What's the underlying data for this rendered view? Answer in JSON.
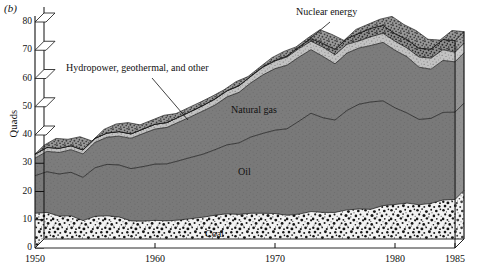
{
  "figure": {
    "panel_label": "(b)",
    "ylabel": "Quads"
  },
  "labels": {
    "coal": "Coal",
    "oil": "Oil",
    "natural_gas": "Natural gas",
    "hydro": "Hydropower, geothermal, and other",
    "nuclear": "Nuclear energy"
  },
  "colors": {
    "coal": "#d9d9d9",
    "oil": "#7b7b7b",
    "natural_gas": "#7b7b7b",
    "hydro": "#bdbdbd",
    "nuclear": "#6e6e6e",
    "outline": "#111111",
    "axis": "#111111",
    "background": "#ffffff"
  },
  "chart_data": {
    "type": "area",
    "title": "",
    "xlabel": "",
    "ylabel": "Quads",
    "xlim": [
      1950,
      1985
    ],
    "ylim": [
      0,
      80
    ],
    "grid": false,
    "legend": "inline-annotations",
    "xticks": [
      1950,
      1960,
      1970,
      1980,
      1985
    ],
    "yticks": [
      0,
      10,
      20,
      30,
      40,
      50,
      60,
      70,
      80
    ],
    "x": [
      1950,
      1951,
      1952,
      1953,
      1954,
      1955,
      1956,
      1957,
      1958,
      1959,
      1960,
      1961,
      1962,
      1963,
      1964,
      1965,
      1966,
      1967,
      1968,
      1969,
      1970,
      1971,
      1972,
      1973,
      1974,
      1975,
      1976,
      1977,
      1978,
      1979,
      1980,
      1981,
      1982,
      1983,
      1984,
      1985
    ],
    "stack_order": [
      "Coal",
      "Oil",
      "Natural gas",
      "Hydropower, geothermal, and other",
      "Nuclear energy"
    ],
    "series": [
      {
        "name": "Coal",
        "values": [
          12.3,
          12.6,
          11.3,
          11.4,
          9.7,
          11.2,
          11.4,
          11.0,
          9.6,
          9.5,
          9.8,
          9.6,
          9.9,
          10.4,
          10.9,
          11.6,
          12.1,
          11.9,
          12.3,
          12.3,
          12.2,
          11.6,
          12.0,
          12.9,
          12.6,
          12.6,
          13.5,
          13.8,
          13.7,
          15.0,
          15.4,
          15.9,
          15.3,
          15.8,
          17.0,
          17.2
        ]
      },
      {
        "name": "Oil",
        "values": [
          13.3,
          14.4,
          14.9,
          15.4,
          15.3,
          17.2,
          18.2,
          18.4,
          18.5,
          19.3,
          19.9,
          20.2,
          21.0,
          21.7,
          22.3,
          23.2,
          24.4,
          25.3,
          27.0,
          28.3,
          29.5,
          30.6,
          32.9,
          34.8,
          33.5,
          32.7,
          35.2,
          37.1,
          38.0,
          37.1,
          34.2,
          31.9,
          30.2,
          30.1,
          31.0,
          30.9
        ]
      },
      {
        "name": "Natural gas",
        "values": [
          6.2,
          7.2,
          7.6,
          8.0,
          8.3,
          9.0,
          9.6,
          10.2,
          10.7,
          11.7,
          12.4,
          12.9,
          13.7,
          14.4,
          15.3,
          15.8,
          17.0,
          17.9,
          19.2,
          20.7,
          21.8,
          22.5,
          22.7,
          22.5,
          21.7,
          19.9,
          20.3,
          19.9,
          20.0,
          20.7,
          20.4,
          19.9,
          18.5,
          17.4,
          18.4,
          17.8
        ]
      },
      {
        "name": "Hydropower, geothermal, and other",
        "values": [
          1.4,
          1.4,
          1.5,
          1.4,
          1.4,
          1.4,
          1.5,
          1.6,
          1.6,
          1.6,
          1.7,
          1.7,
          1.8,
          1.8,
          1.9,
          2.1,
          2.1,
          2.3,
          2.3,
          2.7,
          2.7,
          2.9,
          3.0,
          3.0,
          3.3,
          3.2,
          3.1,
          2.5,
          3.1,
          3.2,
          3.2,
          3.1,
          3.6,
          3.9,
          3.8,
          3.4
        ]
      },
      {
        "name": "Nuclear energy",
        "values": [
          0.0,
          0.0,
          0.0,
          0.0,
          0.0,
          0.0,
          0.0,
          0.0,
          0.0,
          0.0,
          0.0,
          0.0,
          0.0,
          0.1,
          0.1,
          0.1,
          0.1,
          0.1,
          0.1,
          0.2,
          0.2,
          0.4,
          0.6,
          0.9,
          1.3,
          1.9,
          2.1,
          2.7,
          3.0,
          2.8,
          2.7,
          3.0,
          3.1,
          3.2,
          3.6,
          4.1
        ]
      }
    ],
    "totals": [
      33.2,
      35.6,
      35.3,
      36.2,
      34.7,
      38.8,
      40.7,
      41.2,
      40.4,
      42.1,
      43.8,
      44.4,
      46.4,
      48.4,
      50.5,
      52.8,
      55.7,
      57.5,
      60.9,
      64.2,
      66.4,
      68.0,
      71.2,
      74.1,
      72.4,
      70.3,
      74.2,
      76.0,
      77.8,
      78.8,
      75.9,
      73.8,
      70.7,
      70.4,
      73.8,
      73.4
    ]
  }
}
